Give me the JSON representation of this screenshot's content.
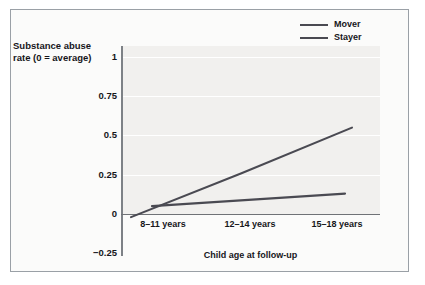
{
  "chart_data": {
    "type": "line",
    "title": "",
    "xlabel": "Child age at follow-up",
    "ylabel": "Substance abuse rate (0 = average)",
    "categories": [
      "8–11 years",
      "12–14 years",
      "15–18 years"
    ],
    "series": [
      {
        "name": "Mover",
        "values": [
          -0.02,
          0.26,
          0.55
        ],
        "color": "#4a4a52"
      },
      {
        "name": "Stayer",
        "values": [
          0.05,
          0.09,
          0.13
        ],
        "color": "#4a4a52"
      }
    ],
    "yticks": [
      "1",
      "0.75",
      "0.5",
      "0.25",
      "0",
      "-0.25"
    ],
    "ytick_values": [
      1,
      0.75,
      0.5,
      0.25,
      0,
      -0.25
    ],
    "ylim": [
      -0.25,
      1
    ],
    "grid": true,
    "legend_position": "top-right",
    "legend": [
      "Mover",
      "Stayer"
    ]
  },
  "axes": {
    "y_label_line1": "Substance abuse",
    "y_label_line2": "rate (0 = average)",
    "x_title": "Child age at follow-up",
    "y_tick_1": "1",
    "y_tick_075": "0.75",
    "y_tick_05": "0.5",
    "y_tick_025": "0.25",
    "y_tick_0": "0",
    "y_tick_neg025": "−0.25",
    "x_tick_1": "8–11 years",
    "x_tick_2": "12–14 years",
    "x_tick_3": "15–18 years"
  },
  "legend": {
    "item_1": "Mover",
    "item_2": "Stayer"
  },
  "colors": {
    "line": "#4a4a52",
    "panel": "#f1f0ee",
    "grid": "#ffffff",
    "axis": "#7d8186",
    "frame": "#9aa0a6",
    "text": "#16161a"
  }
}
